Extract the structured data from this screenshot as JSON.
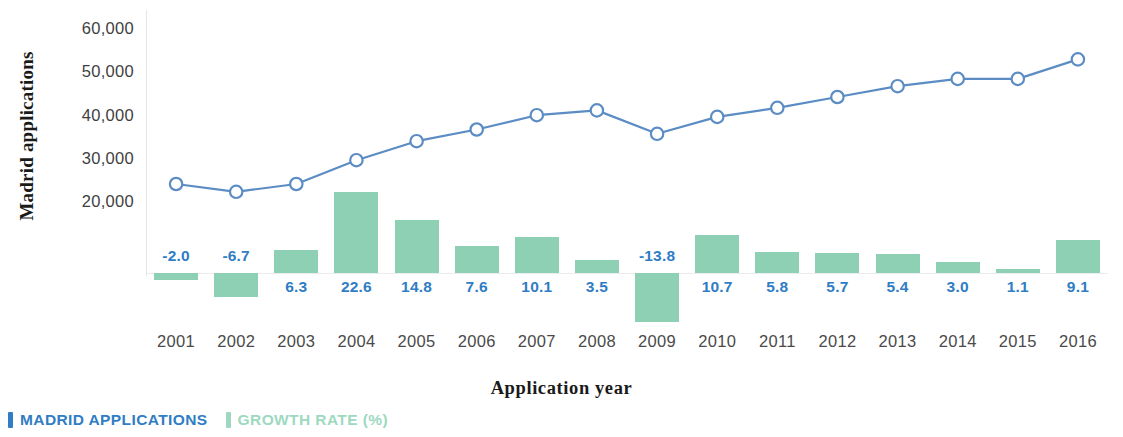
{
  "chart_data": {
    "type": "bar",
    "title": "",
    "xlabel": "Application year",
    "ylabel": "Madrid applications",
    "categories": [
      "2001",
      "2002",
      "2003",
      "2004",
      "2005",
      "2006",
      "2007",
      "2008",
      "2009",
      "2010",
      "2011",
      "2012",
      "2013",
      "2014",
      "2015",
      "2016"
    ],
    "grid": false,
    "legend_position": "bottom-left",
    "yaxis": {
      "label": "Madrid applications",
      "ticks": [
        "20,000",
        "30,000",
        "40,000",
        "50,000",
        "60,000"
      ],
      "tick_values": [
        20000,
        30000,
        40000,
        50000,
        60000
      ],
      "ylim": [
        0,
        60000
      ]
    },
    "secondary_axis": {
      "label": "Growth rate (%)",
      "visible_axis": false,
      "zero_baseline": true
    },
    "series": [
      {
        "name": "MADRID APPLICATIONS",
        "type": "line",
        "color": "#5b8cc4",
        "marker": "open-circle",
        "axis": "left",
        "values": [
          24400,
          22600,
          24400,
          29900,
          34300,
          37000,
          40300,
          41400,
          36000,
          39900,
          42000,
          44500,
          47000,
          48700,
          48700,
          53200
        ]
      },
      {
        "name": "GROWTH RATE (%)",
        "type": "bar",
        "color": "#8ed0b3",
        "axis": "right",
        "values": [
          -2.0,
          -6.7,
          6.3,
          22.6,
          14.8,
          7.6,
          10.1,
          3.5,
          -13.8,
          10.7,
          5.8,
          5.7,
          5.4,
          3.0,
          1.1,
          9.1
        ],
        "labels": [
          "-2.0",
          "-6.7",
          "6.3",
          "22.6",
          "14.8",
          "7.6",
          "10.1",
          "3.5",
          "-13.8",
          "10.7",
          "5.8",
          "5.7",
          "5.4",
          "3.0",
          "1.1",
          "9.1"
        ]
      }
    ]
  },
  "legend": {
    "items": [
      {
        "label": "MADRID APPLICATIONS",
        "color": "#2f7dc4"
      },
      {
        "label": "GROWTH RATE (%)",
        "color": "#9ed9bf"
      }
    ]
  },
  "colors": {
    "line": "#5b8cc4",
    "marker_fill": "#ffffff",
    "bar": "#8ed0b3",
    "data_label": "#2f7dc4",
    "axis_text": "#4a4a4a",
    "axis_line": "#e4e6e8",
    "background": "#ffffff"
  }
}
